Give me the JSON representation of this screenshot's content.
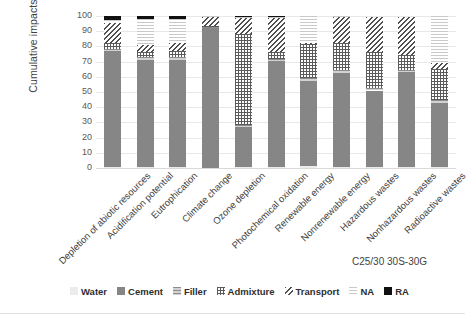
{
  "chart_data": {
    "type": "bar",
    "stacked": true,
    "normalized_percent": true,
    "title": "",
    "subtitle": "",
    "caption": "C25/30 30S-30G",
    "xlabel": "",
    "ylabel": "Cumulative impacts",
    "ylim": [
      0,
      100
    ],
    "ytick_step": 10,
    "yticks": [
      "100",
      "90",
      "80",
      "70",
      "60",
      "50",
      "40",
      "30",
      "20",
      "10",
      "0"
    ],
    "grid": true,
    "legend_position": "bottom",
    "categories": [
      "Depletion of abiotic resources",
      "Acidification potential",
      "Eutrophication",
      "Climate change",
      "Ozone depletion",
      "Photochemical oxidation",
      "Renewable energy",
      "Nonrenewable energy",
      "Hazardous wastes",
      "Nonhazardous wastes",
      "Radioactive wastes"
    ],
    "series": [
      {
        "name": "Water",
        "pattern": "light-solid",
        "color": "#ececec",
        "values": [
          0.5,
          0.5,
          0.5,
          0.3,
          0.5,
          0.5,
          1.0,
          0.5,
          0.5,
          0.5,
          0.5
        ]
      },
      {
        "name": "Cement",
        "pattern": "dark-gray-solid",
        "color": "#868686",
        "values": [
          76.5,
          70.5,
          70.5,
          92.0,
          26.5,
          70.0,
          56.5,
          62.0,
          50.5,
          62.5,
          42.5
        ]
      },
      {
        "name": "Filler",
        "pattern": "horizontal-lines",
        "color": "#d2d2d2",
        "values": [
          1.5,
          2.0,
          2.0,
          0.5,
          1.0,
          1.5,
          2.0,
          2.0,
          1.5,
          1.5,
          2.0
        ]
      },
      {
        "name": "Admixture",
        "pattern": "cross-hatch",
        "color": "#ffffff",
        "values": [
          4.0,
          3.5,
          4.0,
          0.7,
          60.0,
          4.0,
          22.0,
          18.0,
          24.0,
          10.0,
          20.0
        ]
      },
      {
        "name": "Transport",
        "pattern": "diagonal-hatch",
        "color": "#ffffff",
        "values": [
          13.0,
          4.5,
          5.0,
          6.0,
          11.0,
          23.0,
          0.5,
          17.0,
          23.0,
          25.0,
          4.0
        ]
      },
      {
        "name": "NA",
        "pattern": "fine-dotted",
        "color": "#fafafa",
        "values": [
          2.0,
          17.0,
          16.0,
          0.5,
          0.5,
          0.5,
          18.0,
          0.5,
          0.0,
          0.0,
          31.0
        ]
      },
      {
        "name": "RA",
        "pattern": "black-solid",
        "color": "#111111",
        "values": [
          2.5,
          2.0,
          2.0,
          0.0,
          0.5,
          0.5,
          0.0,
          0.0,
          0.0,
          0.0,
          0.0
        ]
      }
    ],
    "legend": [
      {
        "label": "Water",
        "swatch": "s-water"
      },
      {
        "label": "Cement",
        "swatch": "s-cement"
      },
      {
        "label": "Filler",
        "swatch": "s-filler"
      },
      {
        "label": "Admixture",
        "swatch": "s-admixture"
      },
      {
        "label": "Transport",
        "swatch": "s-transport"
      },
      {
        "label": "NA",
        "swatch": "s-na"
      },
      {
        "label": "RA",
        "swatch": "s-ra"
      }
    ]
  }
}
